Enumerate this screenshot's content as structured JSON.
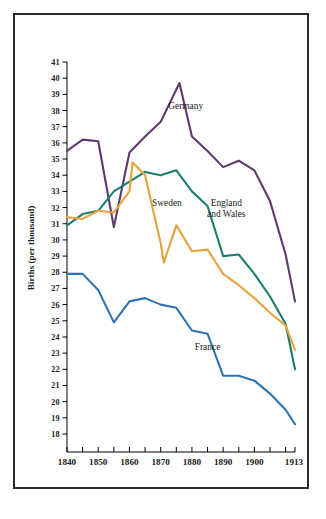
{
  "figure": {
    "border_color": "#2b2b2b",
    "background": "#ffffff"
  },
  "chart_data": {
    "type": "line",
    "title": "",
    "xlabel": "",
    "ylabel": "Births (per thousand)",
    "xlim": [
      1840,
      1913
    ],
    "ylim": [
      18,
      41
    ],
    "grid": false,
    "legend": "inline-annotations",
    "y_ticks": [
      18,
      19,
      20,
      21,
      22,
      23,
      24,
      25,
      26,
      27,
      28,
      29,
      30,
      31,
      32,
      33,
      34,
      35,
      36,
      37,
      38,
      39,
      40,
      41
    ],
    "x_ticks": [
      1840,
      1845,
      1850,
      1855,
      1860,
      1865,
      1870,
      1875,
      1880,
      1885,
      1890,
      1895,
      1900,
      1905,
      1910,
      1913
    ],
    "x_tick_labels": [
      "1840",
      "",
      "1850",
      "",
      "1860",
      "",
      "1870",
      "",
      "1880",
      "",
      "1890",
      "",
      "1900",
      "",
      "",
      "1913"
    ],
    "series": [
      {
        "name": "Germany",
        "color": "#5e3a6e",
        "label_x": 1878,
        "label_y": 38.1,
        "x": [
          1840,
          1845,
          1850,
          1855,
          1860,
          1865,
          1870,
          1875,
          1876,
          1880,
          1885,
          1890,
          1895,
          1900,
          1905,
          1910,
          1913
        ],
        "y": [
          35.5,
          36.2,
          36.1,
          30.8,
          35.4,
          36.4,
          37.3,
          39.3,
          39.7,
          36.4,
          35.5,
          34.5,
          34.9,
          34.3,
          32.4,
          29.1,
          26.2
        ]
      },
      {
        "name": "England and Wales",
        "color": "#1a7f6e",
        "label_x": 1891,
        "label_y": 32.1,
        "x": [
          1840,
          1845,
          1850,
          1855,
          1860,
          1865,
          1870,
          1875,
          1880,
          1885,
          1890,
          1895,
          1900,
          1905,
          1910,
          1913
        ],
        "y": [
          30.9,
          31.6,
          31.8,
          33.0,
          33.6,
          34.2,
          34.0,
          34.3,
          33.0,
          32.1,
          29.0,
          29.1,
          27.9,
          26.5,
          24.8,
          22.0
        ]
      },
      {
        "name": "Sweden",
        "color": "#e8a33d",
        "label_x": 1872,
        "label_y": 32.1,
        "x": [
          1840,
          1845,
          1850,
          1855,
          1860,
          1861,
          1865,
          1870,
          1871,
          1875,
          1880,
          1885,
          1890,
          1895,
          1900,
          1905,
          1910,
          1913
        ],
        "y": [
          31.4,
          31.3,
          31.8,
          31.7,
          33.0,
          34.8,
          34.0,
          29.8,
          28.6,
          30.9,
          29.3,
          29.4,
          27.9,
          27.2,
          26.4,
          25.5,
          24.7,
          23.2
        ]
      },
      {
        "name": "France",
        "color": "#2f73b0",
        "label_x": 1885,
        "label_y": 23.2,
        "x": [
          1840,
          1845,
          1850,
          1855,
          1860,
          1865,
          1870,
          1875,
          1880,
          1885,
          1890,
          1895,
          1900,
          1905,
          1910,
          1913
        ],
        "y": [
          27.9,
          27.9,
          26.9,
          24.9,
          26.2,
          26.4,
          26.0,
          25.8,
          24.4,
          24.2,
          21.6,
          21.6,
          21.3,
          20.5,
          19.5,
          18.6
        ]
      }
    ]
  },
  "labels": {
    "germany": "Germany",
    "england_and_wales_line1": "England",
    "england_and_wales_line2": "and Wales",
    "sweden": "Sweden",
    "france": "France",
    "y_axis_title": "Births (per thousand)"
  }
}
